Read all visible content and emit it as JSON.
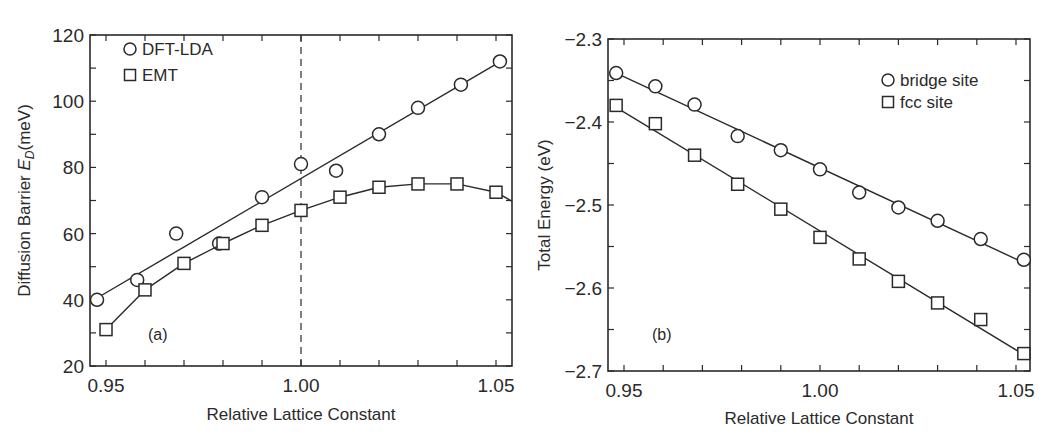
{
  "chart_data": [
    {
      "type": "scatter",
      "panel_label": "(a)",
      "xlabel": "Relative Lattice Constant",
      "ylabel": "Diffusion Barrier E_D(meV)",
      "ylabel_parts": {
        "pre": "Diffusion Barrier ",
        "sym": "E",
        "sub": "D",
        "post": "(meV)"
      },
      "xlim": [
        0.946,
        1.054
      ],
      "ylim": [
        20,
        120
      ],
      "xticks": [
        "0.95",
        "1.00",
        "1.05"
      ],
      "yticks": [
        "20",
        "40",
        "60",
        "80",
        "100",
        "120"
      ],
      "reference_line": {
        "x": 1.0,
        "style": "dashed"
      },
      "legend_position": "upper left",
      "series": [
        {
          "name": "DFT-LDA",
          "marker": "circle",
          "fit": "linear",
          "x": [
            0.9477,
            0.958,
            0.968,
            0.979,
            0.99,
            1.0,
            1.009,
            1.02,
            1.03,
            1.041,
            1.051
          ],
          "values": [
            40,
            46,
            60,
            57,
            71,
            81,
            79,
            90,
            98,
            105,
            112
          ]
        },
        {
          "name": "EMT",
          "marker": "square",
          "fit": "smooth",
          "x": [
            0.95,
            0.96,
            0.97,
            0.98,
            0.99,
            1.0,
            1.01,
            1.02,
            1.03,
            1.04,
            1.05
          ],
          "values": [
            31,
            43,
            51,
            57,
            62.5,
            67,
            71,
            74,
            75,
            75,
            72.5
          ]
        }
      ]
    },
    {
      "type": "scatter",
      "panel_label": "(b)",
      "xlabel": "Relative Lattice Constant",
      "ylabel": "Total Energy (eV)",
      "xlim": [
        0.946,
        1.054
      ],
      "ylim": [
        -2.7,
        -2.3
      ],
      "xticks": [
        "0.95",
        "1.00",
        "1.05"
      ],
      "yticks": [
        "-2.3",
        "-2.4",
        "-2.5",
        "-2.6",
        "-2.7"
      ],
      "legend_position": "upper right",
      "series": [
        {
          "name": "bridge site",
          "marker": "circle",
          "fit": "linear",
          "x": [
            0.948,
            0.958,
            0.968,
            0.979,
            0.99,
            1.0,
            1.01,
            1.02,
            1.03,
            1.041,
            1.052
          ],
          "values": [
            -2.341,
            -2.357,
            -2.379,
            -2.417,
            -2.434,
            -2.457,
            -2.485,
            -2.503,
            -2.519,
            -2.541,
            -2.566
          ]
        },
        {
          "name": "fcc site",
          "marker": "square",
          "fit": "linear",
          "x": [
            0.948,
            0.958,
            0.968,
            0.979,
            0.99,
            1.0,
            1.01,
            1.02,
            1.03,
            1.041,
            1.052
          ],
          "values": [
            -2.38,
            -2.402,
            -2.44,
            -2.475,
            -2.505,
            -2.539,
            -2.565,
            -2.592,
            -2.618,
            -2.638,
            -2.679
          ]
        }
      ]
    }
  ]
}
